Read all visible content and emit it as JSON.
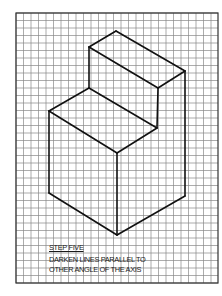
{
  "drawing": {
    "title": "Isometric step block on grid paper",
    "grid": {
      "x0": 16,
      "y0": 13,
      "x1": 218,
      "y1": 283,
      "cell": 7.5,
      "line_color": "#888888",
      "border_color": "#333333"
    },
    "stroke_color": "#111111",
    "edges": [
      [
        116,
        31,
        89,
        47
      ],
      [
        116,
        31,
        185,
        71
      ],
      [
        89,
        47,
        158,
        88
      ],
      [
        158,
        88,
        185,
        71
      ],
      [
        89,
        47,
        89,
        88
      ],
      [
        158,
        88,
        157,
        128
      ],
      [
        185,
        71,
        185,
        196
      ],
      [
        89,
        88,
        49,
        111
      ],
      [
        89,
        88,
        157,
        128
      ],
      [
        49,
        111,
        117,
        153
      ],
      [
        117,
        153,
        157,
        128
      ],
      [
        49,
        111,
        49,
        193
      ],
      [
        117,
        153,
        117,
        235
      ],
      [
        49,
        193,
        117,
        235
      ],
      [
        117,
        235,
        185,
        196
      ]
    ]
  },
  "caption": {
    "title": "STEP FIVE",
    "line1": "DARKEN LINES PARALLEL TO",
    "line2": "OTHER ANGLE OF THE AXIS"
  }
}
